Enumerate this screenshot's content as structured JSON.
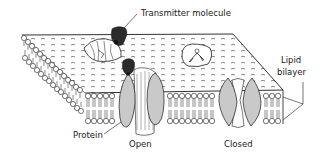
{
  "diagram": {
    "type": "membrane-ion-channel-illustration",
    "labels": {
      "transmitter_molecule": "Transmitter molecule",
      "lipid_bilayer_line1": "Lipid",
      "lipid_bilayer_line2": "bilayer",
      "protein": "Protein",
      "open": "Open",
      "closed": "Closed"
    },
    "elements": [
      {
        "name": "lipid-bilayer-slab",
        "description": "3D membrane slab with phospholipid heads and tails"
      },
      {
        "name": "transmitter-molecule-top",
        "description": "dark molecule bound to surface receptor (top view)"
      },
      {
        "name": "receptor-top-view-bound",
        "description": "channel protein seen from above, with transmitter"
      },
      {
        "name": "receptor-top-view-unbound",
        "description": "channel protein seen from above, no transmitter"
      },
      {
        "name": "open-channel",
        "description": "cross-section of channel in open state with transmitter bound"
      },
      {
        "name": "closed-channel",
        "description": "cross-section of channel in closed state"
      }
    ],
    "colors": {
      "line": "#1a1a1a",
      "protein_fill": "#c9c9c9",
      "molecule_fill": "#2b2b2b",
      "background": "#ffffff"
    }
  }
}
